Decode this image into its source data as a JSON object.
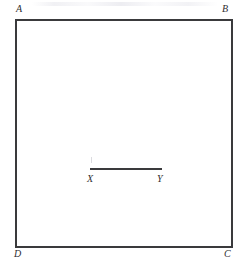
{
  "figure": {
    "name": "rectangle-abcd-with-segment-xy",
    "background_color": "#ffffff",
    "stroke_color": "#3a3a3c",
    "label_color": "#2e2e30",
    "rectangle": {
      "name": "rectangle-abcd",
      "vertices": [
        {
          "id": "A",
          "label": "A",
          "position": "top-left"
        },
        {
          "id": "B",
          "label": "B",
          "position": "top-right"
        },
        {
          "id": "C",
          "label": "C",
          "position": "bottom-right"
        },
        {
          "id": "D",
          "label": "D",
          "position": "bottom-left"
        }
      ]
    },
    "segment": {
      "name": "segment-xy",
      "endpoints": [
        {
          "id": "X",
          "label": "X",
          "position": "left"
        },
        {
          "id": "Y",
          "label": "Y",
          "position": "right"
        }
      ]
    }
  }
}
